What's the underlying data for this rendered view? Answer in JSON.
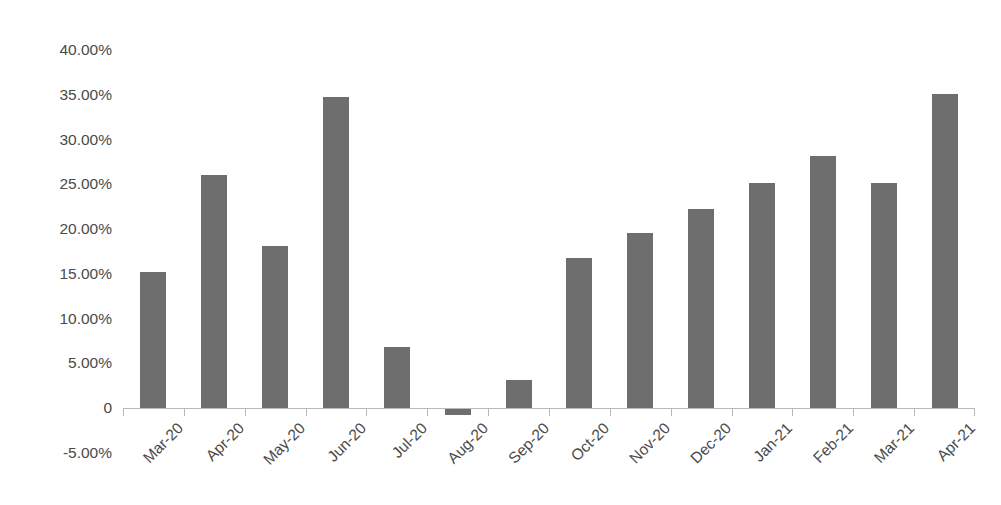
{
  "chart_data": {
    "type": "bar",
    "title": "",
    "subtitle": "",
    "xlabel": "",
    "ylabel": "",
    "legend": [],
    "legend_position": "none",
    "grid": false,
    "orientation": "vertical",
    "value_format": "percent",
    "categories": [
      "Mar-20",
      "Apr-20",
      "May-20",
      "Jun-20",
      "Jul-20",
      "Aug-20",
      "Sep-20",
      "Oct-20",
      "Nov-20",
      "Dec-20",
      "Jan-21",
      "Feb-21",
      "Mar-21",
      "Apr-21"
    ],
    "values": [
      15.2,
      26.0,
      18.1,
      34.8,
      6.8,
      -0.8,
      3.1,
      16.8,
      19.6,
      22.2,
      25.1,
      28.2,
      25.1,
      35.1
    ],
    "ylim": [
      -5,
      40
    ],
    "ytick_values": [
      40,
      35,
      30,
      25,
      20,
      15,
      10,
      5,
      0,
      -5
    ],
    "ytick_labels": [
      "40.00%",
      "35.00%",
      "30.00%",
      "25.00%",
      "20.00%",
      "15.00%",
      "10.00%",
      "5.00%",
      "0",
      "-5.00%"
    ],
    "colors": {
      "bar": "#6e6e6e",
      "axis": "#b8b8b8",
      "text": "#4a4a4a",
      "background": "#ffffff"
    }
  }
}
